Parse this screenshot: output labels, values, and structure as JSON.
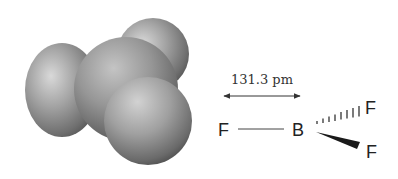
{
  "figure": {
    "molecule": "BF3",
    "space_filling_model": {
      "atoms": [
        {
          "name": "fluorine-back",
          "cx": 153,
          "cy": 54,
          "r": 36
        },
        {
          "name": "fluorine-left",
          "cx": 62,
          "cy": 90,
          "r": 39
        },
        {
          "name": "boron-center",
          "cx": 126,
          "cy": 89,
          "r": 55
        },
        {
          "name": "fluorine-front",
          "cx": 148,
          "cy": 121,
          "r": 44
        }
      ],
      "color_base": "#8a8a8a",
      "color_highlight": "#d6d6d6",
      "color_shadow": "#4a4a4a"
    },
    "structure": {
      "bond_length_label": "131.3 pm",
      "atoms": {
        "left_f": "F",
        "center_b": "B",
        "upper_right_f": "F",
        "lower_right_f": "F"
      },
      "bond_types": {
        "left": "plain",
        "upper_right": "hashed",
        "lower_right": "wedge"
      }
    }
  }
}
